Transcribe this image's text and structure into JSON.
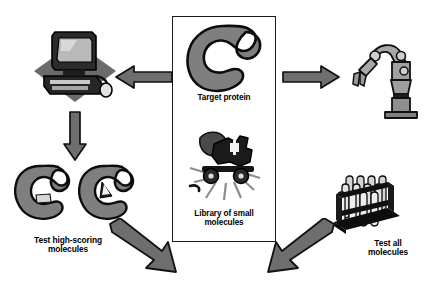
{
  "diagram": {
    "type": "process-flow",
    "background_color": "#ffffff",
    "palette": {
      "protein_fill": "#7f7f7f",
      "protein_outline": "#0d0d0d",
      "arrow_fill": "#6e6e6e",
      "arrow_outline": "#111111",
      "box_border": "#1a1a1a",
      "text": "#000000",
      "rack_black": "#101010",
      "device_gray": "#8a8a8a",
      "shadow_gray": "#6b6b6b"
    }
  },
  "center_box": {
    "name": "central-panel",
    "items": [
      {
        "key": "target_protein",
        "label": "Target protein",
        "icon": "protein-c-shape-icon",
        "description": "C-shaped gray protein blob with binding cleft"
      },
      {
        "key": "library_small_molecules",
        "label": "Library of small\nmolecules",
        "icon": "compound-library-machine-icon",
        "description": "Dark machine clipart with radiating lines"
      }
    ]
  },
  "branches": {
    "left": {
      "key": "virtual_screening",
      "icon": "desktop-computer-icon",
      "icon_description": "Desktop computer with monitor, keyboard and mouse on gray diamond shadow",
      "result_icon": "docked-protein-pair-icon",
      "result_description": "Two C-shaped proteins each with a small molecule docked in the cleft",
      "label": "Test high-scoring\nmolecules"
    },
    "right": {
      "key": "experimental_screening",
      "icon": "robotic-arm-icon",
      "icon_description": "Articulated laboratory robot arm with gripper on pedestal base",
      "result_icon": "test-tube-rack-icon",
      "result_description": "Black rack holding rows of test tubes",
      "label": "Test all\nmolecules"
    }
  },
  "arrows": [
    {
      "key": "box-to-computer",
      "name": "arrow-left",
      "direction": "left",
      "style": "gray-filled-outlined"
    },
    {
      "key": "box-to-robot",
      "name": "arrow-right",
      "direction": "right",
      "style": "gray-filled-outlined"
    },
    {
      "key": "computer-to-docked",
      "name": "arrow-down",
      "direction": "down",
      "style": "gray-filled-outlined"
    },
    {
      "key": "docked-to-result",
      "name": "arrow-diagonal-down-right",
      "direction": "down-right",
      "style": "gray-filled-outlined"
    },
    {
      "key": "rack-to-result",
      "name": "arrow-diagonal-down-left",
      "direction": "down-left",
      "style": "gray-filled-outlined"
    }
  ]
}
